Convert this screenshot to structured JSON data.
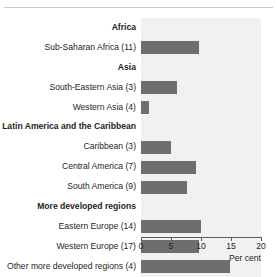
{
  "chart_data": {
    "type": "bar",
    "orientation": "horizontal",
    "title": "",
    "xlabel": "Per cent",
    "ylabel": "",
    "xlim": [
      0,
      20
    ],
    "xticks": [
      0,
      5,
      10,
      15,
      20
    ],
    "xtick_labels": [
      "0",
      "5",
      "10",
      "15",
      "20"
    ],
    "grid": false,
    "legend": null,
    "colors": {
      "bar": "#6e6e6e",
      "plot_background": "#f1f1f1",
      "axis": "#5a5a5a",
      "text": "#231f20",
      "top_rule": "#c9c9c9"
    },
    "rows": [
      {
        "label": "Africa",
        "heading": true,
        "value": null
      },
      {
        "label": "Sub-Saharan Africa (11)",
        "heading": false,
        "value": 9.7
      },
      {
        "label": "Asia",
        "heading": true,
        "value": null
      },
      {
        "label": "South-Eastern Asia (3)",
        "heading": false,
        "value": 6.0
      },
      {
        "label": "Western Asia (4)",
        "heading": false,
        "value": 1.4
      },
      {
        "label": "Latin America and the Caribbean",
        "heading": true,
        "value": null
      },
      {
        "label": "Caribbean (3)",
        "heading": false,
        "value": 5.0
      },
      {
        "label": "Central America (7)",
        "heading": false,
        "value": 9.1
      },
      {
        "label": "South America (9)",
        "heading": false,
        "value": 7.7
      },
      {
        "label": "More developed regions",
        "heading": true,
        "value": null
      },
      {
        "label": "Eastern Europe (14)",
        "heading": false,
        "value": 10.0
      },
      {
        "label": "Western Europe (17)",
        "heading": false,
        "value": 9.7
      },
      {
        "label": "Other more developed regions (4)",
        "heading": false,
        "value": 14.8
      }
    ],
    "categories": [
      "Sub-Saharan Africa (11)",
      "South-Eastern Asia (3)",
      "Western Asia (4)",
      "Caribbean (3)",
      "Central America (7)",
      "South America (9)",
      "Eastern Europe (14)",
      "Western Europe (17)",
      "Other more developed regions (4)"
    ],
    "values": [
      9.7,
      6.0,
      1.4,
      5.0,
      9.1,
      7.7,
      10.0,
      9.7,
      14.8
    ]
  }
}
